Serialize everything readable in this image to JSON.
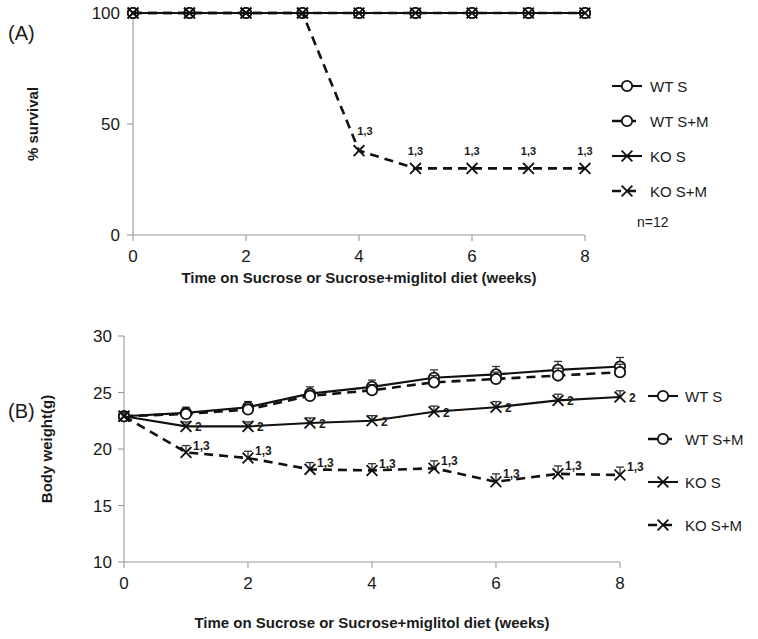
{
  "figure": {
    "panel_a_label": "(A)",
    "panel_b_label": "(B)",
    "sample_size_note": "n=12"
  },
  "chart_data": [
    {
      "id": "panel-a",
      "type": "line",
      "title": "",
      "xlabel": "Time on Sucrose or Sucrose+miglitol diet (weeks)",
      "ylabel": "% survival",
      "x": [
        0,
        1,
        2,
        3,
        4,
        5,
        6,
        7,
        8
      ],
      "xlim": [
        0,
        8
      ],
      "ylim": [
        0,
        100
      ],
      "xticks": [
        0,
        2,
        4,
        6,
        8
      ],
      "xtick_labels": [
        "0",
        "2",
        "4",
        "6",
        "8"
      ],
      "yticks": [
        0,
        50,
        100
      ],
      "ytick_labels": [
        "0",
        "50",
        "100"
      ],
      "grid": false,
      "legend_position": "right",
      "annotation_note": "n=12",
      "series": [
        {
          "name": "WT S",
          "marker": "circle",
          "dash": false,
          "values": [
            100,
            100,
            100,
            100,
            100,
            100,
            100,
            100,
            100
          ],
          "annotations": [
            "",
            "",
            "",
            "",
            "",
            "",
            "",
            "",
            ""
          ]
        },
        {
          "name": "WT S+M",
          "marker": "circle",
          "dash": true,
          "values": [
            100,
            100,
            100,
            100,
            100,
            100,
            100,
            100,
            100
          ],
          "annotations": [
            "",
            "",
            "",
            "",
            "",
            "",
            "",
            "",
            ""
          ]
        },
        {
          "name": "KO S",
          "marker": "x",
          "dash": false,
          "values": [
            100,
            100,
            100,
            100,
            100,
            100,
            100,
            100,
            100
          ],
          "annotations": [
            "",
            "",
            "",
            "",
            "",
            "",
            "",
            "",
            ""
          ]
        },
        {
          "name": "KO S+M",
          "marker": "x",
          "dash": true,
          "values": [
            100,
            100,
            100,
            100,
            38,
            30,
            30,
            30,
            30
          ],
          "annotations": [
            "",
            "",
            "",
            "",
            "1,3",
            "1,3",
            "1,3",
            "1,3",
            "1,3"
          ]
        }
      ]
    },
    {
      "id": "panel-b",
      "type": "line",
      "title": "",
      "xlabel": "Time on Sucrose or Sucrose+miglitol diet (weeks)",
      "ylabel": "Body weight(g)",
      "x": [
        0,
        1,
        2,
        3,
        4,
        5,
        6,
        7,
        8
      ],
      "xlim": [
        0,
        8
      ],
      "ylim": [
        10,
        30
      ],
      "xticks": [
        0,
        2,
        4,
        6,
        8
      ],
      "xtick_labels": [
        "0",
        "2",
        "4",
        "6",
        "8"
      ],
      "yticks": [
        10,
        15,
        20,
        25,
        30
      ],
      "ytick_labels": [
        "10",
        "15",
        "20",
        "25",
        "30"
      ],
      "grid": false,
      "legend_position": "right",
      "series": [
        {
          "name": "WT S",
          "marker": "circle",
          "dash": false,
          "values": [
            22.9,
            23.2,
            23.7,
            24.9,
            25.5,
            26.3,
            26.6,
            27.0,
            27.3
          ],
          "errors": [
            0.35,
            0.5,
            0.5,
            0.6,
            0.6,
            0.7,
            0.7,
            0.75,
            0.8
          ],
          "annotations": [
            "",
            "",
            "",
            "",
            "",
            "",
            "",
            "",
            ""
          ]
        },
        {
          "name": "WT S+M",
          "marker": "circle",
          "dash": true,
          "values": [
            22.9,
            23.1,
            23.5,
            24.7,
            25.2,
            25.9,
            26.2,
            26.5,
            26.8
          ],
          "errors": [
            0.3,
            0.4,
            0.4,
            0.5,
            0.5,
            0.6,
            0.6,
            0.65,
            0.7
          ],
          "annotations": [
            "",
            "",
            "",
            "",
            "",
            "",
            "",
            "",
            ""
          ]
        },
        {
          "name": "KO S",
          "marker": "x",
          "dash": false,
          "values": [
            22.9,
            22.0,
            22.0,
            22.3,
            22.5,
            23.3,
            23.7,
            24.3,
            24.6
          ],
          "errors": [
            0.3,
            0.4,
            0.4,
            0.45,
            0.45,
            0.5,
            0.5,
            0.55,
            0.55
          ],
          "annotations": [
            "",
            "2",
            "2",
            "2",
            "2",
            "2",
            "2",
            "2",
            "2"
          ]
        },
        {
          "name": "KO S+M",
          "marker": "x",
          "dash": true,
          "values": [
            22.9,
            19.7,
            19.2,
            18.2,
            18.1,
            18.3,
            17.1,
            17.8,
            17.7
          ],
          "errors": [
            0.3,
            0.6,
            0.6,
            0.6,
            0.6,
            0.65,
            0.7,
            0.7,
            0.7
          ],
          "annotations": [
            "",
            "1,3",
            "1,3",
            "1,3",
            "1,3",
            "1,3",
            "1,3",
            "1,3",
            "1,3"
          ]
        }
      ]
    }
  ]
}
